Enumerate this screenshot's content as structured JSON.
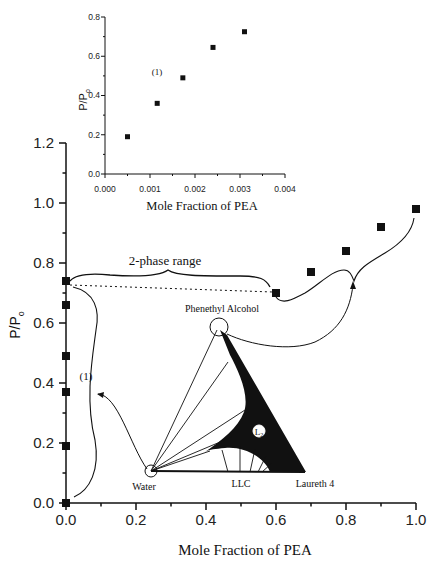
{
  "chart_data": [
    {
      "type": "scatter",
      "name": "main",
      "title": "",
      "xlabel": "Mole Fraction of PEA",
      "ylabel": "P/P₀",
      "xlim": [
        0.0,
        1.0
      ],
      "ylim": [
        0.0,
        1.2
      ],
      "xticks": [
        "0.0",
        "0.2",
        "0.4",
        "0.6",
        "0.8",
        "1.0"
      ],
      "yticks": [
        "0.0",
        "0.2",
        "0.4",
        "0.6",
        "0.8",
        "1.0",
        "1.2"
      ],
      "grid": false,
      "series": [
        {
          "name": "measured",
          "marker": "square",
          "x": [
            0.0,
            0.0,
            0.0,
            0.0,
            0.0,
            0.0,
            0.6,
            0.7,
            0.8,
            0.9,
            1.0
          ],
          "y": [
            0.0,
            0.19,
            0.37,
            0.49,
            0.66,
            0.74,
            0.7,
            0.77,
            0.84,
            0.92,
            0.98
          ]
        }
      ],
      "annotations": [
        {
          "text": "2-phase range",
          "x": 0.3,
          "y": 0.8
        },
        {
          "text": "(1)",
          "x": 0.06,
          "y": 0.4
        },
        {
          "text": "Phenethyl Alcohol",
          "x": 0.42,
          "y": 0.65
        },
        {
          "text": "Water",
          "x": 0.18,
          "y": 0.06
        },
        {
          "text": "LLC",
          "x": 0.48,
          "y": 0.06
        },
        {
          "text": "Laureth 4",
          "x": 0.66,
          "y": 0.06
        },
        {
          "text": "L₂",
          "x": 0.5,
          "y": 0.27
        }
      ],
      "reference_line": {
        "style": "dotted",
        "y": 0.74,
        "x_from": 0.0,
        "x_to": 0.6
      }
    },
    {
      "type": "scatter",
      "name": "inset",
      "title": "",
      "xlabel": "Mole Fraction of PEA",
      "ylabel": "P/P₀",
      "xlim": [
        0.0,
        0.004
      ],
      "ylim": [
        0.0,
        0.8
      ],
      "xticks": [
        "0.000",
        "0.001",
        "0.002",
        "0.003",
        "0.004"
      ],
      "yticks": [
        "0.0",
        "0.2",
        "0.4",
        "0.6",
        "0.8"
      ],
      "grid": false,
      "series": [
        {
          "name": "measured",
          "marker": "square",
          "x": [
            0.0005,
            0.00116,
            0.00173,
            0.0024,
            0.0031
          ],
          "y": [
            0.19,
            0.36,
            0.49,
            0.645,
            0.725
          ]
        }
      ],
      "annotations": [
        {
          "text": "(1)",
          "x": 0.0012,
          "y": 0.52
        }
      ]
    }
  ],
  "labels": {
    "main_xlabel": "Mole Fraction of PEA",
    "main_ylabel_p": "P/P",
    "main_ylabel_sub": "o",
    "inset_xlabel": "Mole Fraction of PEA",
    "inset_ylabel_p": "P/P",
    "inset_ylabel_sub": "o",
    "two_phase": "2-phase range",
    "region1_main": "(1)",
    "region1_inset": "(1)",
    "vertex_top": "Phenethyl Alcohol",
    "vertex_left": "Water",
    "vertex_right": "Laureth 4",
    "phase_llc": "LLC",
    "phase_l2": "L",
    "phase_l2_sub": "2"
  }
}
